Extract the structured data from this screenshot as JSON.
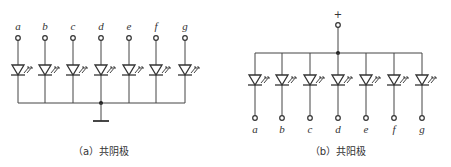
{
  "diagram_a": {
    "caption": "（a）共阴极",
    "segments": [
      "a",
      "b",
      "c",
      "d",
      "e",
      "f",
      "g"
    ],
    "type": "common-cathode",
    "columns_x": [
      18,
      45,
      73,
      101,
      129,
      156,
      185
    ]
  },
  "diagram_b": {
    "caption": "（b）共阳极",
    "plus_label": "+",
    "segments": [
      "a",
      "b",
      "c",
      "d",
      "e",
      "f",
      "g"
    ],
    "type": "common-anode",
    "columns_x": [
      255,
      282,
      310,
      338,
      366,
      394,
      422
    ]
  },
  "colors": {
    "line": "#444444",
    "text": "#333333"
  }
}
